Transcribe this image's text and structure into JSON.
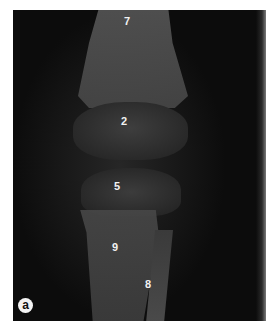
{
  "figure": {
    "panel_label": "a",
    "background_color": "#0c0c0c",
    "labels": [
      {
        "text": "7",
        "x": 124,
        "y": 16
      },
      {
        "text": "2",
        "x": 121,
        "y": 116
      },
      {
        "text": "5",
        "x": 114,
        "y": 181
      },
      {
        "text": "9",
        "x": 112,
        "y": 242
      },
      {
        "text": "8",
        "x": 145,
        "y": 279
      }
    ]
  }
}
